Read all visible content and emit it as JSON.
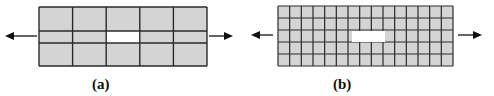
{
  "figure": {
    "panels": [
      {
        "id": "a",
        "label": "(a)",
        "description": "Coarse mesh plate with central hole under tension",
        "mesh": {
          "columns": 5,
          "rows_y": [
            7,
            31,
            43,
            66
          ],
          "x_start": 39,
          "x_end": 207
        },
        "hole": {
          "column": 3,
          "row": 2
        },
        "arrows": [
          "left",
          "right"
        ]
      },
      {
        "id": "b",
        "label": "(b)",
        "description": "Fine mesh plate with central hole under tension",
        "mesh": {
          "columns": 15,
          "rows": 5,
          "x_start": 278,
          "x_end": 453,
          "y_start": 6,
          "y_end": 66
        },
        "hole": {
          "x": 352,
          "y": 31,
          "width": 33,
          "height": 11
        },
        "arrows": [
          "left",
          "right"
        ]
      }
    ],
    "colors": {
      "cell_fill": "#d4d4d4",
      "grid_line": "#2a2a2a",
      "hole_fill": "#ffffff",
      "arrow": "#111111"
    }
  }
}
